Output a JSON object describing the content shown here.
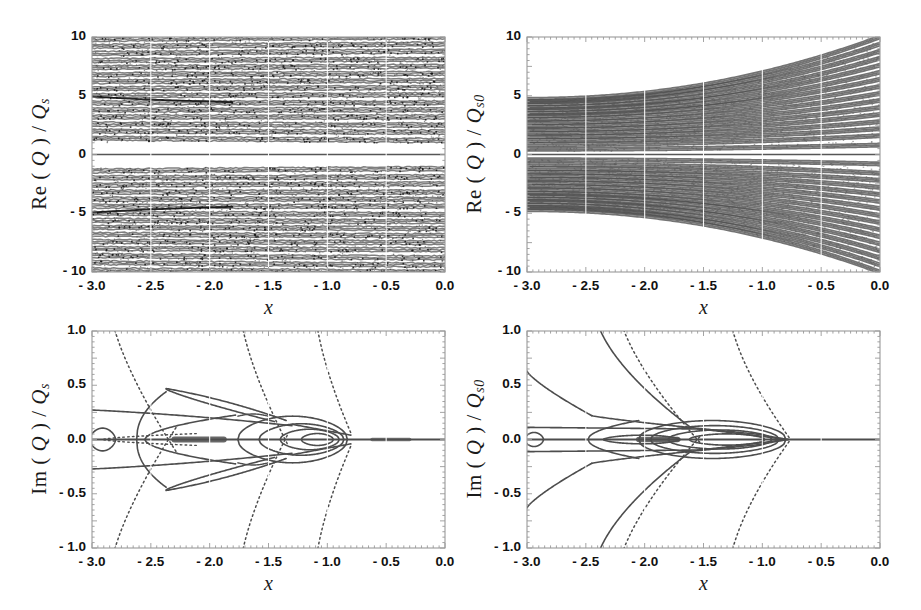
{
  "figure": {
    "background": "#ffffff",
    "width": 921,
    "height": 610,
    "line_color": "#4d4d4d",
    "frame_color": "#9a9a9a"
  },
  "panels": [
    {
      "id": "top-left",
      "ylabel_parts": {
        "fn": "Re (",
        "q": "Q",
        "mid": ") / ",
        "q2": "Q",
        "sub": "s"
      },
      "ylabel_text": "Re ( Q ) / Q s",
      "xlabel": "x",
      "xticks": [
        "- 3.0",
        "- 2.5",
        "- 2.0",
        "- 1.5",
        "- 1.0",
        "0.0"
      ],
      "xtick_values": [
        -3.0,
        -2.5,
        -2.0,
        -1.5,
        -1.0,
        0.0
      ],
      "xticks_full": [
        "- 3.0",
        "- 2.5",
        "- 2.0",
        "- 1.5",
        "- 1.0",
        "- 0.5",
        "0.0"
      ],
      "xtick_values_full": [
        -3.0,
        -2.5,
        -2.0,
        -1.5,
        -1.0,
        -0.5,
        0.0
      ],
      "yticks": [
        "10",
        "5",
        "0",
        "- 5",
        "- 10"
      ],
      "ytick_values": [
        10,
        5,
        0,
        -5,
        -10
      ],
      "xlim": [
        -3.0,
        0.0
      ],
      "ylim": [
        -10,
        10
      ]
    },
    {
      "id": "top-right",
      "ylabel_parts": {
        "fn": "Re (",
        "q": "Q",
        "mid": ") / ",
        "q2": "Q",
        "sub": "s0"
      },
      "ylabel_text": "Re ( Q ) / Q s0",
      "xlabel": "x",
      "xticks_full": [
        "- 3.0",
        "- 2.5",
        "- 2.0",
        "- 1.5",
        "- 1.0",
        "- 0.5",
        "0.0"
      ],
      "xtick_values_full": [
        -3.0,
        -2.5,
        -2.0,
        -1.5,
        -1.0,
        -0.5,
        0.0
      ],
      "yticks": [
        "10",
        "5",
        "0",
        "- 5",
        "- 10"
      ],
      "ytick_values": [
        10,
        5,
        0,
        -5,
        -10
      ],
      "xlim": [
        -3.0,
        0.0
      ],
      "ylim": [
        -10,
        10
      ]
    },
    {
      "id": "bottom-left",
      "ylabel_parts": {
        "fn": "Im (",
        "q": "Q",
        "mid": ") / ",
        "q2": "Q",
        "sub": "s"
      },
      "ylabel_text": "Im ( Q ) / Q s",
      "xlabel": "x",
      "xticks_full": [
        "- 3.0",
        "- 2.5",
        "- 2.0",
        "- 1.5",
        "- 1.0",
        "- 0.5",
        "0.0"
      ],
      "xtick_values_full": [
        -3.0,
        -2.5,
        -2.0,
        -1.5,
        -1.0,
        -0.5,
        0.0
      ],
      "yticks": [
        "1.0",
        "0.5",
        "0.0",
        "- 0.5",
        "- 1.0"
      ],
      "ytick_values": [
        1.0,
        0.5,
        0.0,
        -0.5,
        -1.0
      ],
      "xlim": [
        -3.0,
        0.0
      ],
      "ylim": [
        -1.0,
        1.0
      ]
    },
    {
      "id": "bottom-right",
      "ylabel_parts": {
        "fn": "Im (",
        "q": "Q",
        "mid": ") / ",
        "q2": "Q",
        "sub": "s0"
      },
      "ylabel_text": "Im ( Q ) / Q s0",
      "xlabel": "x",
      "xticks_full": [
        "- 3.0",
        "- 2.5",
        "- 2.0",
        "- 1.5",
        "- 1.0",
        "- 0.5",
        "0.0"
      ],
      "xtick_values_full": [
        -3.0,
        -2.5,
        -2.0,
        -1.5,
        -1.0,
        -0.5,
        0.0
      ],
      "yticks": [
        "1.0",
        "0.5",
        "0.0",
        "- 0.5",
        "- 1.0"
      ],
      "ytick_values": [
        1.0,
        0.5,
        0.0,
        -0.5,
        -1.0
      ],
      "xlim": [
        -3.0,
        0.0
      ],
      "ylim": [
        -1.0,
        1.0
      ]
    }
  ],
  "chart_data": [
    {
      "type": "line",
      "panel": "top-left",
      "title": "",
      "xlabel": "x",
      "ylabel": "Re (Q) / Q_s",
      "xlim": [
        -3.0,
        0.0
      ],
      "ylim": [
        -10,
        10
      ],
      "xticks": [
        -3.0,
        -2.5,
        -2.0,
        -1.5,
        -1.0,
        -0.5,
        0.0
      ],
      "xticklabels": [
        "- 3.0",
        "- 2.5",
        "- 2.0",
        "- 1.5",
        "- 1.0",
        "- 0.5",
        "0.0"
      ],
      "yticks": [
        10,
        5,
        0,
        -5,
        -10
      ],
      "yticklabels": [
        "10",
        "5",
        "0",
        "- 5",
        "- 10"
      ],
      "grid": true,
      "legend": "none",
      "description": "Dense family of ~48 nearly horizontal noisy branches filling the band from -10 to 10, mirror symmetric about Re(Q)=0, with a clean isolated branch exactly at 0 and white gaps near +/-1.2; branches drift slightly upward toward x=0 and bunch near +/-5.",
      "series_count": 48,
      "symmetric": true,
      "noise": true,
      "y_at_x_minus3": [
        -9.8,
        -9.2,
        -8.6,
        -8.0,
        -7.4,
        -6.8,
        -6.2,
        -5.6,
        -5.0,
        -4.4,
        -3.8,
        -3.2,
        -2.6,
        -2.0,
        -1.4,
        0.0,
        1.4,
        2.0,
        2.6,
        3.2,
        3.8,
        4.4,
        5.0,
        5.6,
        6.2,
        6.8,
        7.4,
        8.0,
        8.6,
        9.2,
        9.8
      ],
      "y_at_x_0": [
        -10.0,
        -9.4,
        -8.8,
        -8.1,
        -7.5,
        -6.9,
        -6.3,
        -5.7,
        -5.1,
        -4.4,
        -3.8,
        -3.2,
        -2.5,
        -1.9,
        -1.2,
        0.0,
        1.2,
        1.9,
        2.5,
        3.2,
        3.8,
        4.4,
        5.1,
        5.7,
        6.3,
        6.9,
        7.5,
        8.1,
        8.8,
        9.4,
        10.0
      ]
    },
    {
      "type": "line",
      "panel": "top-right",
      "title": "",
      "xlabel": "x",
      "ylabel": "Re (Q) / Q_s0",
      "xlim": [
        -3.0,
        0.0
      ],
      "ylim": [
        -10,
        10
      ],
      "xticks": [
        -3.0,
        -2.5,
        -2.0,
        -1.5,
        -1.0,
        -0.5,
        0.0
      ],
      "xticklabels": [
        "- 3.0",
        "- 2.5",
        "- 2.0",
        "- 1.5",
        "- 1.0",
        "- 0.5",
        "0.0"
      ],
      "yticks": [
        10,
        5,
        0,
        -5,
        -10
      ],
      "yticklabels": [
        "10",
        "5",
        "0",
        "- 5",
        "- 10"
      ],
      "grid": true,
      "legend": "none",
      "description": "Fan of ~46 smooth curves, symmetric about 0, compressed into the band +/-4.7 at x=-3.0 and spreading to fill +/-10 at x=0. A flat branch lies exactly on Re=0 and white gaps separate the inner branches near +/-0.4.",
      "series_count": 46,
      "symmetric": true,
      "band_halfwidth_at_x_minus3": 4.7,
      "band_halfwidth_at_x_0": 10.0,
      "y_at_x_minus3": [
        -4.7,
        -4.5,
        -4.3,
        -4.0,
        -3.8,
        -3.5,
        -3.3,
        -3.0,
        -2.7,
        -2.4,
        -2.1,
        -1.8,
        -1.5,
        -1.2,
        -0.85,
        -0.45,
        0.0,
        0.45,
        0.85,
        1.2,
        1.5,
        1.8,
        2.1,
        2.4,
        2.7,
        3.0,
        3.3,
        3.5,
        3.8,
        4.0,
        4.3,
        4.5,
        4.7
      ],
      "y_at_x_0": [
        -10.0,
        -9.4,
        -8.8,
        -8.2,
        -7.6,
        -7.0,
        -6.4,
        -5.8,
        -5.2,
        -4.6,
        -4.0,
        -3.4,
        -2.8,
        -2.2,
        -1.6,
        -0.8,
        0.0,
        0.8,
        1.6,
        2.2,
        2.8,
        3.4,
        4.0,
        4.6,
        5.2,
        5.8,
        6.4,
        7.0,
        7.6,
        8.2,
        8.8,
        9.4,
        10.0
      ]
    },
    {
      "type": "line",
      "panel": "bottom-left",
      "title": "",
      "xlabel": "x",
      "ylabel": "Im (Q) / Q_s",
      "xlim": [
        -3.0,
        0.0
      ],
      "ylim": [
        -1.0,
        1.0
      ],
      "xticks": [
        -3.0,
        -2.5,
        -2.0,
        -1.5,
        -1.0,
        -0.5,
        0.0
      ],
      "xticklabels": [
        "- 3.0",
        "- 2.5",
        "- 2.0",
        "- 1.5",
        "- 1.0",
        "- 0.5",
        "0.0"
      ],
      "yticks": [
        1.0,
        0.5,
        0.0,
        -0.5,
        -1.0
      ],
      "yticklabels": [
        "1.0",
        "0.5",
        "0.0",
        "- 0.5",
        "- 1.0"
      ],
      "grid": true,
      "legend": "none",
      "description": "Bifurcation diagram symmetric about Im=0. A solid baseline runs along Im=0 across the whole range. Nested lens/teardrop loops pinch off at x ~= -2.9, -1.75, -1.45 and -0.8. Two dotted hyperbola-like branches rise steeply out of the frame near x = -2.75, -1.6 and -1.05. Outer solid branch starts at +/-0.27 at x=-3.0 and merges toward 0 near x=-0.9.",
      "baseline_value": 0.0,
      "outer_branch_at_x_minus3": 0.27,
      "lens_peak": 0.47,
      "lens_peak_x": -2.35,
      "pinch_points_x": [
        -2.9,
        -1.75,
        -1.45,
        -0.8
      ],
      "dotted_branch_x_at_top": [
        -2.85,
        -1.72,
        -1.12
      ],
      "dotted_branch_x_at_bottom": [
        -2.72,
        -1.58,
        -1.05
      ]
    },
    {
      "type": "line",
      "panel": "bottom-right",
      "title": "",
      "xlabel": "x",
      "ylabel": "Im (Q) / Q_s0",
      "xlim": [
        -3.0,
        0.0
      ],
      "ylim": [
        -1.0,
        1.0
      ],
      "xticks": [
        -3.0,
        -2.5,
        -2.0,
        -1.5,
        -1.0,
        -0.5,
        0.0
      ],
      "xticklabels": [
        "- 3.0",
        "- 2.5",
        "- 2.0",
        "- 1.5",
        "- 1.0",
        "- 0.5",
        "0.0"
      ],
      "yticks": [
        1.0,
        0.5,
        0.0,
        -0.5,
        -1.0
      ],
      "yticklabels": [
        "1.0",
        "0.5",
        "0.0",
        "- 0.5",
        "- 1.0"
      ],
      "grid": true,
      "legend": "none",
      "description": "Similar bifurcation structure, symmetric about Im=0, with a solid baseline along Im=0. A large solid branch leaves x=-3.0 at +/-0.63 and curves to a knee at x ~= -2.45, Im ~= +/-0.22 then runs inward. A second branch at +/-0.11 at x=-3.0. Nested loops collapse between x = -2.0 and -1.1, and dotted branches sweep from the corners up through x ~= -1.5 to -0.8 exiting the top and bottom of the frame.",
      "baseline_value": 0.0,
      "outer_branch_at_x_minus3": 0.63,
      "second_branch_at_x_minus3": 0.11,
      "knee_x": -2.45,
      "knee_value": 0.22,
      "pinch_points_x": [
        -2.9,
        -1.95,
        -1.5,
        -0.78
      ],
      "dotted_branch_x_at_top": [
        -2.2,
        -1.22
      ],
      "dotted_branch_x_at_bottom": [
        -2.2,
        -1.3
      ]
    }
  ]
}
